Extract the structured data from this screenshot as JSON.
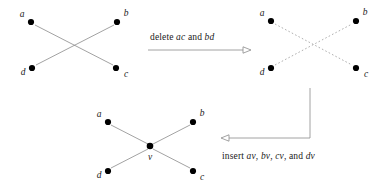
{
  "figure": {
    "background_color": "#ffffff",
    "solid_edge_color": "#8a8a8a",
    "dashed_edge_color": "#9a9a9a",
    "arrow_color": "#8a8a8a",
    "node_color": "#000000",
    "text_color": "#1a1a1a"
  },
  "graph1": {
    "name": "original-graph",
    "nodes": [
      {
        "id": "a",
        "label": "a",
        "x": 31,
        "y": 22,
        "label_x": 22,
        "label_y": 14
      },
      {
        "id": "b",
        "label": "b",
        "x": 117,
        "y": 22,
        "label_x": 124,
        "label_y": 13
      },
      {
        "id": "d",
        "label": "d",
        "x": 32,
        "y": 68,
        "label_x": 23,
        "label_y": 72
      },
      {
        "id": "c",
        "label": "c",
        "x": 116,
        "y": 68,
        "label_x": 124,
        "label_y": 74
      }
    ],
    "edges": [
      {
        "from": "a",
        "to": "c",
        "style": "solid"
      },
      {
        "from": "d",
        "to": "b",
        "style": "solid"
      }
    ]
  },
  "graph2": {
    "name": "graph-after-deletion",
    "nodes": [
      {
        "id": "a",
        "label": "a",
        "x": 271,
        "y": 21,
        "label_x": 262,
        "label_y": 13
      },
      {
        "id": "b",
        "label": "b",
        "x": 356,
        "y": 21,
        "label_x": 363,
        "label_y": 12
      },
      {
        "id": "d",
        "label": "d",
        "x": 271,
        "y": 68,
        "label_x": 262,
        "label_y": 72
      },
      {
        "id": "c",
        "label": "c",
        "x": 356,
        "y": 68,
        "label_x": 363,
        "label_y": 74
      }
    ],
    "edges": [
      {
        "from": "a",
        "to": "c",
        "style": "dashed"
      },
      {
        "from": "d",
        "to": "b",
        "style": "dashed"
      }
    ]
  },
  "graph3": {
    "name": "graph-after-insertion",
    "nodes": [
      {
        "id": "a",
        "label": "a",
        "x": 108,
        "y": 122,
        "label_x": 99,
        "label_y": 114
      },
      {
        "id": "b",
        "label": "b",
        "x": 193,
        "y": 122,
        "label_x": 200,
        "label_y": 113
      },
      {
        "id": "d",
        "label": "d",
        "x": 108,
        "y": 171,
        "label_x": 99,
        "label_y": 175
      },
      {
        "id": "c",
        "label": "c",
        "x": 193,
        "y": 171,
        "label_x": 200,
        "label_y": 177
      },
      {
        "id": "v",
        "label": "v",
        "x": 150,
        "y": 146,
        "label_x": 150,
        "label_y": 159
      }
    ],
    "edges": [
      {
        "from": "a",
        "to": "v",
        "style": "solid"
      },
      {
        "from": "b",
        "to": "v",
        "style": "solid"
      },
      {
        "from": "c",
        "to": "v",
        "style": "solid"
      },
      {
        "from": "d",
        "to": "v",
        "style": "solid"
      }
    ]
  },
  "transitions": {
    "delete": {
      "text_prefix": "delete ",
      "operand1": "ac",
      "text_middle": " and ",
      "operand2": "bd",
      "full_text": "delete ac and bd",
      "arrow_direction": "right"
    },
    "insert": {
      "text_prefix": "insert ",
      "operand1": "av",
      "sep1": ", ",
      "operand2": "bv",
      "sep2": ", ",
      "operand3": "cv",
      "text_middle": ", and ",
      "operand4": "dv",
      "full_text": "insert av, bv, cv, and dv",
      "arrow_direction": "down-then-left"
    }
  }
}
